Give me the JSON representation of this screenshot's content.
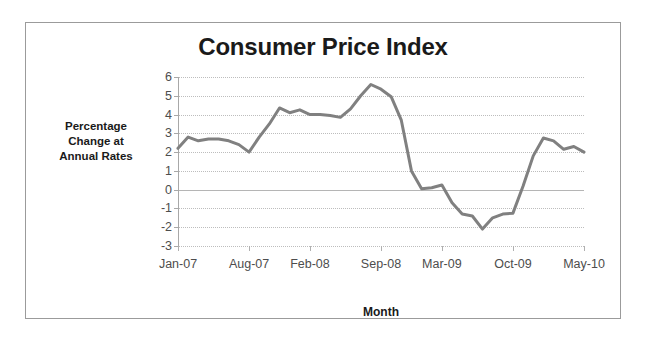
{
  "chart_data": {
    "type": "line",
    "title": "Consumer Price Index",
    "xlabel": "Month",
    "ylabel": "Percentage Change at Annual Rates",
    "ylabel_lines": [
      "Percentage",
      "Change at",
      "Annual Rates"
    ],
    "ylim": [
      -3,
      6
    ],
    "yticks": [
      6,
      5,
      4,
      3,
      2,
      1,
      0,
      -1,
      -2,
      -3
    ],
    "ytick_labels": [
      "6",
      "5",
      "4",
      "3",
      "2",
      "1",
      "0",
      "-1",
      "-2",
      "-3"
    ],
    "grid": true,
    "grid_axis": "y",
    "legend": false,
    "legend_position": "none",
    "line_color": "#808080",
    "line_width": 3,
    "xtick_labels": [
      "Jan-07",
      "Aug-07",
      "Feb-08",
      "Sep-08",
      "Mar-09",
      "Oct-09",
      "May-10"
    ],
    "xtick_indices": [
      0,
      7,
      13,
      20,
      26,
      33,
      40
    ],
    "x": [
      "Jan-07",
      "Feb-07",
      "Mar-07",
      "Apr-07",
      "May-07",
      "Jun-07",
      "Jul-07",
      "Aug-07",
      "Sep-07",
      "Oct-07",
      "Nov-07",
      "Dec-07",
      "Jan-08",
      "Feb-08",
      "Mar-08",
      "Apr-08",
      "May-08",
      "Jun-08",
      "Jul-08",
      "Aug-08",
      "Sep-08",
      "Oct-08",
      "Nov-08",
      "Dec-08",
      "Jan-09",
      "Feb-09",
      "Mar-09",
      "Apr-09",
      "May-09",
      "Jun-09",
      "Jul-09",
      "Aug-09",
      "Sep-09",
      "Oct-09",
      "Nov-09",
      "Dec-09",
      "Jan-10",
      "Feb-10",
      "Mar-10",
      "Apr-10",
      "May-10"
    ],
    "values": [
      2.2,
      2.8,
      2.6,
      2.7,
      2.7,
      2.6,
      2.4,
      2.0,
      2.8,
      3.5,
      4.35,
      4.1,
      4.25,
      4.0,
      4.0,
      3.95,
      3.85,
      4.3,
      5.0,
      5.6,
      5.35,
      4.95,
      3.7,
      1.0,
      0.05,
      0.1,
      0.25,
      -0.7,
      -1.3,
      -1.4,
      -2.1,
      -1.5,
      -1.3,
      -1.25,
      0.2,
      1.8,
      2.75,
      2.6,
      2.15,
      2.3,
      2.0
    ],
    "series_name": "Consumer Price Index"
  },
  "layout": {
    "plot_left": 152,
    "plot_top": 54,
    "plot_width": 406,
    "plot_height": 169
  }
}
